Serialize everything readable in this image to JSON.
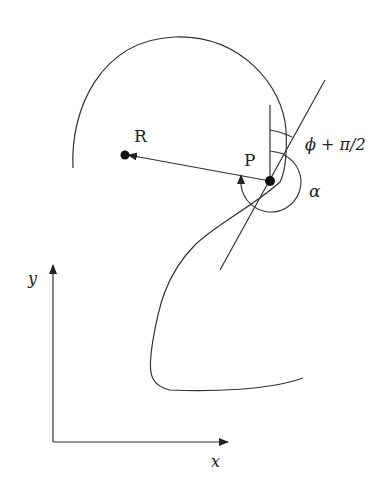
{
  "diagram": {
    "points": {
      "R": {
        "label": "R",
        "x": 125,
        "y": 155
      },
      "P": {
        "label": "P",
        "x": 270,
        "y": 181
      }
    },
    "angles": {
      "phi_plus_half_pi": {
        "label": "ϕ + π/2"
      },
      "alpha": {
        "label": "α"
      }
    },
    "axes": {
      "x_label": "x",
      "y_label": "y"
    },
    "stroke_color": "#333333"
  }
}
